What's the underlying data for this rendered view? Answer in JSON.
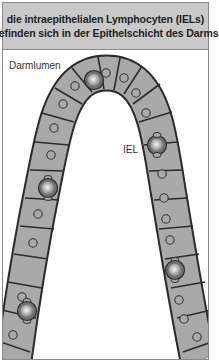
{
  "title": {
    "line1": "die intraepithelialen Lymphocyten (IELs)",
    "line2": "befinden sich in der Epithelschicht des Darms"
  },
  "labels": {
    "lumen": "Darmlumen",
    "iel": "IEL"
  },
  "colors": {
    "title_background": "#c9c9c9",
    "cell_fill": "#a9a9a9",
    "cell_outline": "#2b2b2b",
    "nucleus_outline": "#333333",
    "iel_fill": "#7d7d7d",
    "iel_highlight": "#f2f2f2",
    "border": "#8a8a8a"
  },
  "diagram": {
    "structure": "intestinal-villus-epithelium",
    "epithelial_cells_left": 12,
    "epithelial_cells_right": 12,
    "iel_count": 5
  }
}
